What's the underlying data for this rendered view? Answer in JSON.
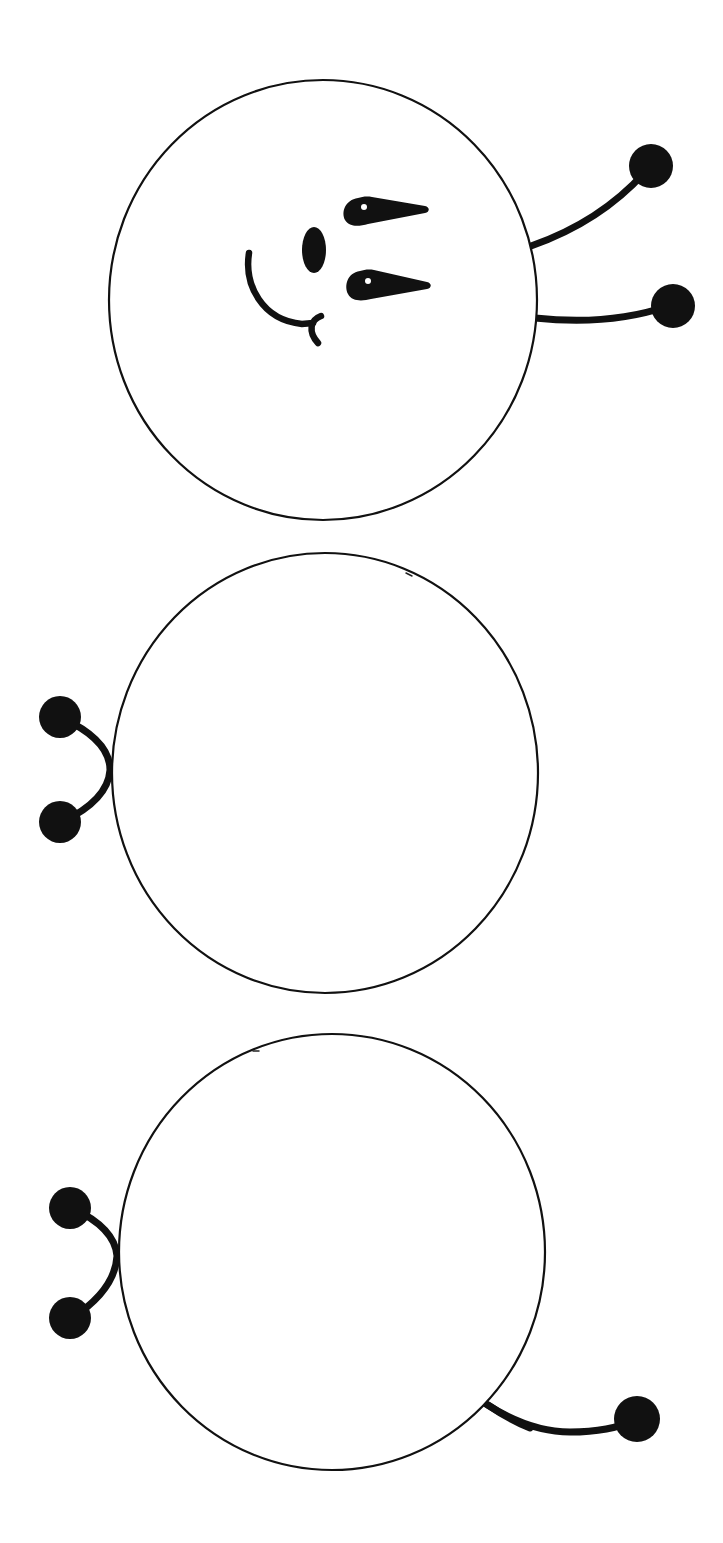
{
  "illustration": {
    "subject": "caterpillar-line-art",
    "orientation": "rotated-90-degrees",
    "colors": {
      "ink": "#111111",
      "paper": "#ffffff"
    },
    "segments": [
      {
        "id": "head",
        "cx": 323,
        "cy": 300,
        "rx": 214,
        "ry": 220,
        "has_face": true
      },
      {
        "id": "body-1",
        "cx": 325,
        "cy": 773,
        "rx": 213,
        "ry": 220,
        "has_face": false
      },
      {
        "id": "body-2",
        "cx": 332,
        "cy": 1252,
        "rx": 213,
        "ry": 218,
        "has_face": false
      }
    ],
    "face": {
      "eyes": 2,
      "nose": 1,
      "mouth": "smile"
    },
    "antennae": {
      "count": 2,
      "side": "right"
    },
    "legs": [
      {
        "segment": "body-1",
        "count": 2,
        "side": "left"
      },
      {
        "segment": "body-2",
        "count": 2,
        "side": "left"
      },
      {
        "segment": "body-2",
        "count": 1,
        "side": "bottom-right"
      }
    ]
  }
}
